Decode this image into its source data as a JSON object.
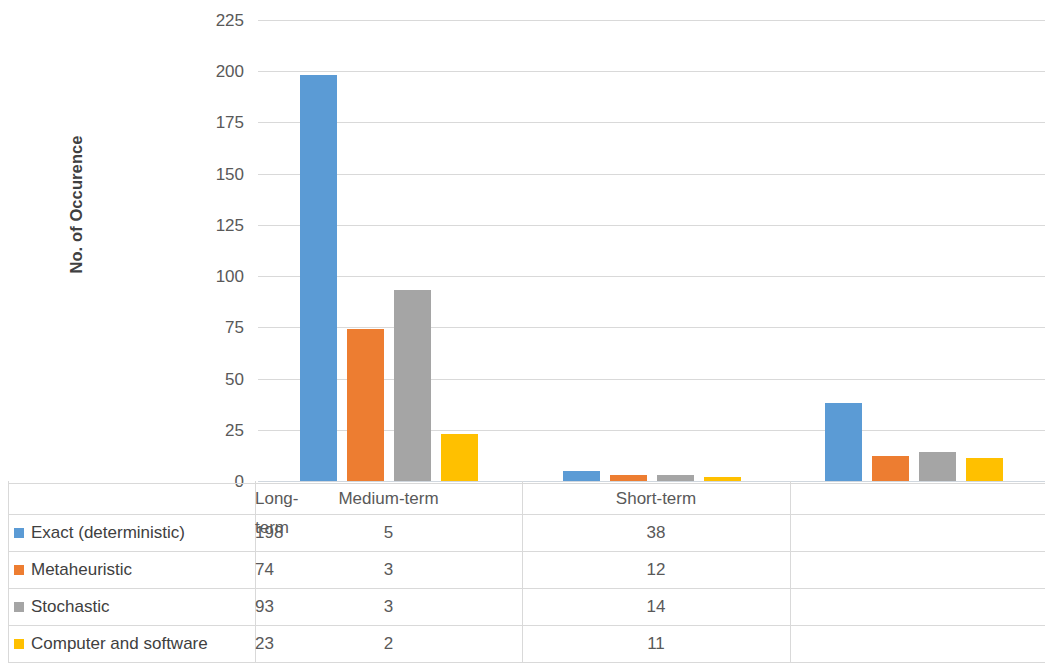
{
  "chart_data": {
    "type": "bar",
    "title": "",
    "xlabel": "",
    "ylabel": "No. of Occurence",
    "ylim": [
      0,
      225
    ],
    "ytick_step": 25,
    "yticks": [
      "225",
      "200",
      "175",
      "150",
      "125",
      "100",
      "75",
      "50",
      "25",
      "0"
    ],
    "grid": true,
    "legend_position": "data-table",
    "categories": [
      "Long-term",
      "Medium-term",
      "Short-term"
    ],
    "series": [
      {
        "name": "Exact (deterministic)",
        "color": "#5B9BD5",
        "values": [
          198,
          5,
          38
        ]
      },
      {
        "name": "Metaheuristic",
        "color": "#ED7D31",
        "values": [
          74,
          3,
          12
        ]
      },
      {
        "name": "Stochastic",
        "color": "#A5A5A5",
        "values": [
          93,
          3,
          14
        ]
      },
      {
        "name": "Computer and software",
        "color": "#FFC000",
        "values": [
          23,
          2,
          11
        ]
      }
    ]
  },
  "axis": {
    "y_title": "No. of Occurence"
  },
  "table": {
    "column_headers": [
      "Long-term",
      "Medium-term",
      "Short-term"
    ],
    "rows": [
      {
        "label": "Exact (deterministic)",
        "color": "#5B9BD5",
        "values": [
          "198",
          "5",
          "38"
        ]
      },
      {
        "label": "Metaheuristic",
        "color": "#ED7D31",
        "values": [
          "74",
          "3",
          "12"
        ]
      },
      {
        "label": "Stochastic",
        "color": "#A5A5A5",
        "values": [
          "93",
          "3",
          "14"
        ]
      },
      {
        "label": "Computer and software",
        "color": "#FFC000",
        "values": [
          "23",
          "2",
          "11"
        ]
      }
    ]
  }
}
